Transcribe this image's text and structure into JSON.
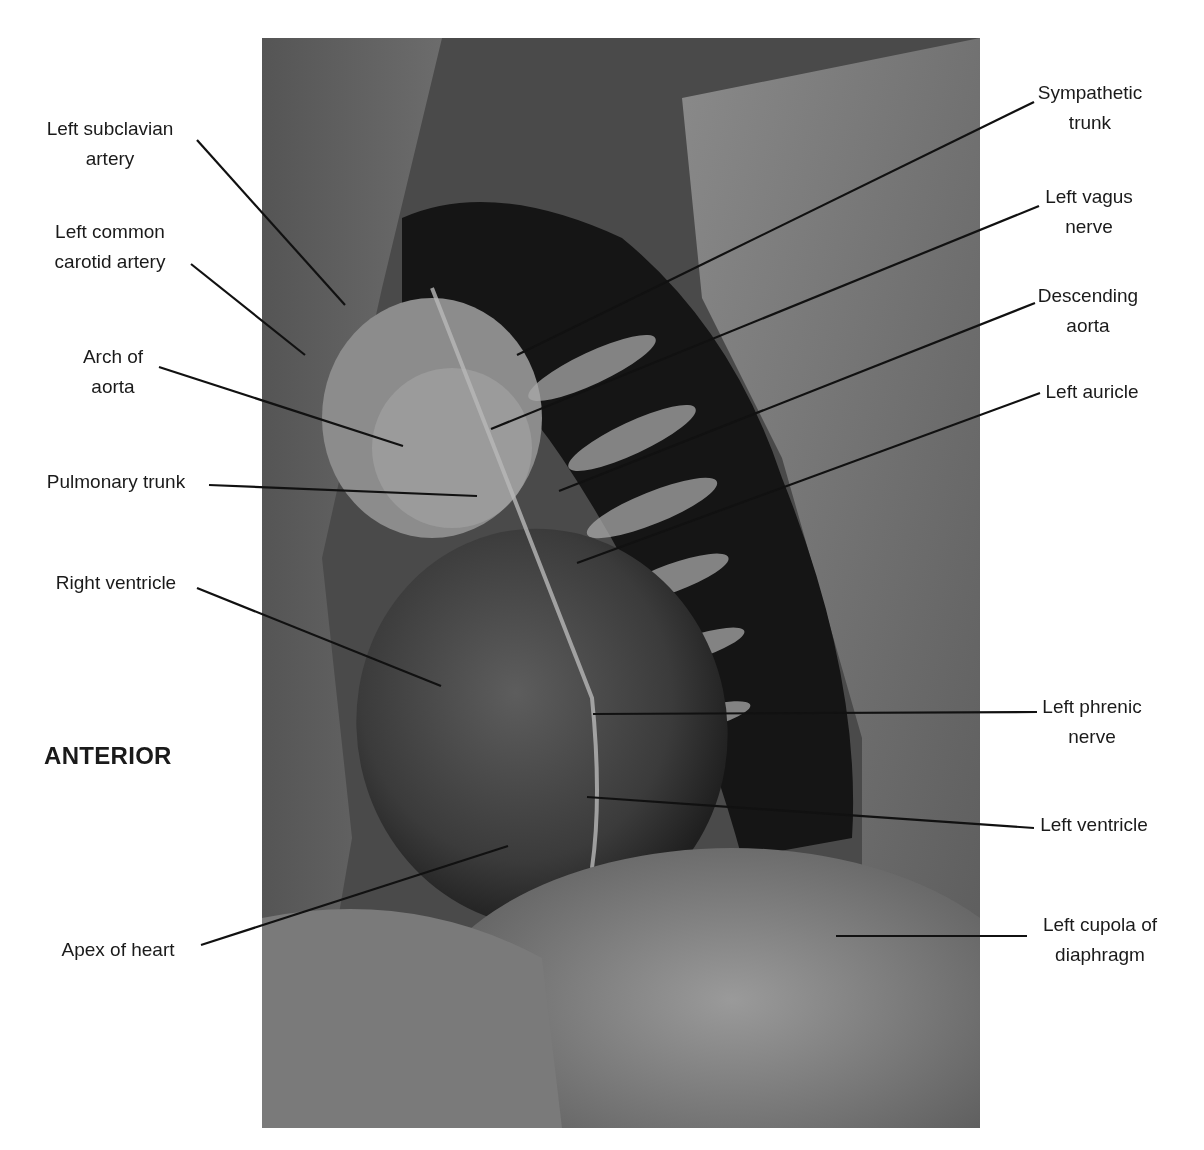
{
  "figure": {
    "orientation_label": "ANTERIOR",
    "photo": {
      "x": 262,
      "y": 38,
      "width": 718,
      "height": 1090,
      "tone": "grayscale"
    },
    "line_color": "#111111"
  },
  "labels_left": [
    {
      "id": "left-subclavian-artery",
      "lines": [
        "Left subclavian",
        "artery"
      ],
      "text_x": 110,
      "text_y": 114,
      "leader": [
        197,
        140,
        345,
        305
      ]
    },
    {
      "id": "left-common-carotid-artery",
      "lines": [
        "Left common",
        "carotid artery"
      ],
      "text_x": 110,
      "text_y": 217,
      "leader": [
        191,
        264,
        305,
        355
      ]
    },
    {
      "id": "arch-of-aorta",
      "lines": [
        "Arch of",
        "aorta"
      ],
      "text_x": 113,
      "text_y": 342,
      "leader": [
        159,
        367,
        403,
        446
      ]
    },
    {
      "id": "pulmonary-trunk",
      "lines": [
        "Pulmonary trunk"
      ],
      "text_x": 116,
      "text_y": 467,
      "leader": [
        209,
        485,
        477,
        496
      ]
    },
    {
      "id": "right-ventricle",
      "lines": [
        "Right ventricle"
      ],
      "text_x": 116,
      "text_y": 568,
      "leader": [
        197,
        588,
        441,
        686
      ]
    },
    {
      "id": "apex-of-heart",
      "lines": [
        "Apex of heart"
      ],
      "text_x": 118,
      "text_y": 935,
      "leader": [
        201,
        945,
        508,
        846
      ]
    }
  ],
  "labels_right": [
    {
      "id": "sympathetic-trunk",
      "lines": [
        "Sympathetic",
        "trunk"
      ],
      "text_x": 1090,
      "text_y": 78,
      "leader": [
        1034,
        102,
        517,
        355
      ]
    },
    {
      "id": "left-vagus-nerve",
      "lines": [
        "Left vagus",
        "nerve"
      ],
      "text_x": 1089,
      "text_y": 182,
      "leader": [
        1039,
        206,
        491,
        429
      ]
    },
    {
      "id": "descending-aorta",
      "lines": [
        "Descending",
        "aorta"
      ],
      "text_x": 1088,
      "text_y": 281,
      "leader": [
        1035,
        303,
        559,
        491
      ]
    },
    {
      "id": "left-auricle",
      "lines": [
        "Left auricle"
      ],
      "text_x": 1092,
      "text_y": 377,
      "leader": [
        1040,
        393,
        577,
        563
      ]
    },
    {
      "id": "left-phrenic-nerve",
      "lines": [
        "Left phrenic",
        "nerve"
      ],
      "text_x": 1092,
      "text_y": 692,
      "leader": [
        1037,
        712,
        593,
        714
      ]
    },
    {
      "id": "left-ventricle",
      "lines": [
        "Left ventricle"
      ],
      "text_x": 1094,
      "text_y": 810,
      "leader": [
        1034,
        828,
        587,
        797
      ]
    },
    {
      "id": "left-cupola-of-diaphragm",
      "lines": [
        "Left cupola of",
        "diaphragm"
      ],
      "text_x": 1100,
      "text_y": 910,
      "leader": [
        1027,
        936,
        836,
        936
      ]
    }
  ]
}
